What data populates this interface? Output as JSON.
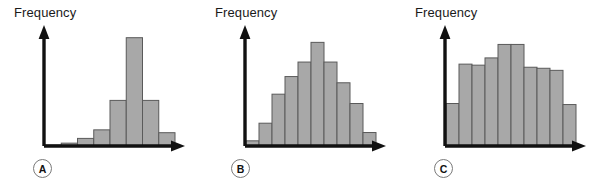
{
  "figure": {
    "background": "#ffffff",
    "bar_fill": "#a8a8a8",
    "bar_stroke": "#5a5a5a",
    "axis_color": "#111111"
  },
  "panels": [
    {
      "tag": "A",
      "axis_label": "Frequency",
      "shape": "symmetric with sharp central peak",
      "chart": {
        "type": "bar",
        "title": "",
        "xlabel": "",
        "ylabel": "Frequency",
        "categories": [
          "1",
          "2",
          "3",
          "4",
          "5",
          "6",
          "7",
          "8"
        ],
        "values": [
          1,
          3,
          8,
          17,
          48,
          114,
          48,
          14
        ],
        "ylim": [
          0,
          120
        ],
        "grid": false,
        "legend": "none"
      }
    },
    {
      "tag": "B",
      "axis_label": "Frequency",
      "shape": "bell shaped / mound",
      "chart": {
        "type": "bar",
        "title": "",
        "xlabel": "",
        "ylabel": "Frequency",
        "categories": [
          "1",
          "2",
          "3",
          "4",
          "5",
          "6",
          "7",
          "8",
          "9",
          "10"
        ],
        "values": [
          5,
          22,
          50,
          67,
          81,
          100,
          81,
          61,
          41,
          13
        ],
        "ylim": [
          0,
          110
        ],
        "grid": false,
        "legend": "none"
      }
    },
    {
      "tag": "C",
      "axis_label": "Frequency",
      "shape": "uniform / rectangular",
      "chart": {
        "type": "bar",
        "title": "",
        "xlabel": "",
        "ylabel": "Frequency",
        "categories": [
          "1",
          "2",
          "3",
          "4",
          "5",
          "6",
          "7",
          "8",
          "9",
          "10"
        ],
        "values": [
          41,
          79,
          78,
          85,
          98,
          98,
          76,
          75,
          73,
          40
        ],
        "ylim": [
          0,
          110
        ],
        "grid": false,
        "legend": "none"
      }
    }
  ]
}
